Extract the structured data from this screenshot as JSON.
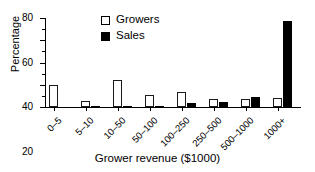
{
  "chart_data": {
    "type": "bar",
    "title": "",
    "xlabel": "Grower revenue ($1000)",
    "ylabel": "Percentage",
    "categories": [
      "0–5",
      "5–10",
      "10–50",
      "50–100",
      "100–250",
      "250–500",
      "500–1000",
      "1000+"
    ],
    "series": [
      {
        "name": "Growers",
        "color": "#ffffff",
        "edgecolor": "#000000",
        "values": [
          19.5,
          5.5,
          24.5,
          10.5,
          13.5,
          7.0,
          7.5,
          8.0
        ]
      },
      {
        "name": "Sales",
        "color": "#000000",
        "edgecolor": "#000000",
        "values": [
          0.0,
          0.7,
          0.8,
          0.7,
          3.5,
          4.5,
          8.8,
          77.0
        ]
      }
    ],
    "ylim": [
      0,
      80
    ],
    "yticks": [
      0,
      20,
      40,
      60,
      80
    ],
    "ytick_labels": [
      "0",
      "20",
      "40",
      "60",
      "80"
    ],
    "yminor_ticks": [
      10,
      30,
      50,
      70
    ],
    "grid": false,
    "legend_position": "upper center",
    "legend_entries": [
      "Growers",
      "Sales"
    ]
  },
  "axes": {
    "y_title": "Percentage",
    "x_title": "Grower revenue ($1000)"
  },
  "legend": {
    "items": [
      {
        "label": "Growers",
        "swatch": "open-square-icon"
      },
      {
        "label": "Sales",
        "swatch": "filled-square-icon"
      }
    ]
  }
}
